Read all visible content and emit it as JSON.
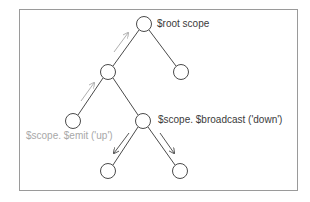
{
  "diagram": {
    "labels": {
      "root": "$root scope",
      "broadcast": "$scope. $broadcast ('down')",
      "emit": "$scope. $emit ('up')"
    },
    "colors": {
      "frame": "#9a9a9a",
      "node_stroke": "#4a4a4a",
      "edge": "#4a4a4a",
      "label_dark": "#3a3a3a",
      "label_grey": "#a8a8a8",
      "emit_arrow": "#b0b0b0",
      "broadcast_arrow": "#555555"
    },
    "nodes": [
      {
        "id": "root",
        "x": 144,
        "y": 24
      },
      {
        "id": "l2-left",
        "x": 108,
        "y": 72
      },
      {
        "id": "l2-right",
        "x": 181,
        "y": 72
      },
      {
        "id": "l3-left",
        "x": 73,
        "y": 121
      },
      {
        "id": "l3-right",
        "x": 143,
        "y": 121
      },
      {
        "id": "l4-left",
        "x": 108,
        "y": 171
      },
      {
        "id": "l4-right",
        "x": 180,
        "y": 171
      }
    ],
    "edges": [
      [
        "root",
        "l2-left"
      ],
      [
        "root",
        "l2-right"
      ],
      [
        "l2-left",
        "l3-left"
      ],
      [
        "l2-left",
        "l3-right"
      ],
      [
        "l3-right",
        "l4-left"
      ],
      [
        "l3-right",
        "l4-right"
      ]
    ]
  }
}
